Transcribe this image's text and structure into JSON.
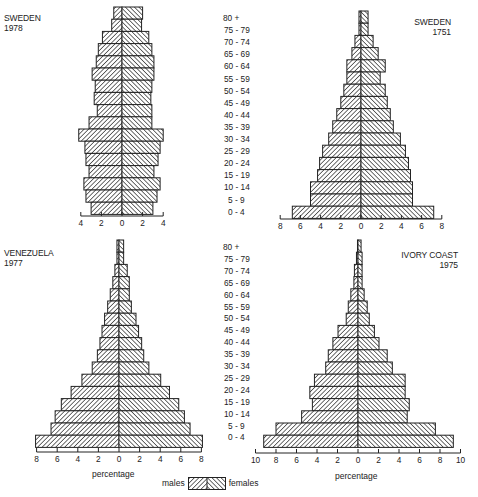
{
  "age_groups": [
    "80 +",
    "75 - 79",
    "70 - 74",
    "65 - 69",
    "60 - 64",
    "55 - 59",
    "50 - 54",
    "45 - 49",
    "40 - 44",
    "35 - 39",
    "30 - 34",
    "25 - 29",
    "20 - 24",
    "15 - 19",
    "10 - 14",
    "5 - 9",
    "0 - 4"
  ],
  "legend": {
    "males": "males",
    "females": "females"
  },
  "axis_title": "percentage",
  "colors": {
    "ink": "#222222",
    "fill": "#ffffff"
  },
  "chart_data": [
    {
      "type": "bar",
      "subtype": "population-pyramid",
      "title": "SWEDEN 1978",
      "country": "SWEDEN",
      "year": "1978",
      "xlabel": "",
      "ylabel": "age group",
      "x_ticks": [
        4,
        2,
        0,
        2,
        4
      ],
      "xlim": [
        -4,
        4
      ],
      "categories": [
        "80 +",
        "75 - 79",
        "70 - 74",
        "65 - 69",
        "60 - 64",
        "55 - 59",
        "50 - 54",
        "45 - 49",
        "40 - 44",
        "35 - 39",
        "30 - 34",
        "25 - 29",
        "20 - 24",
        "15 - 19",
        "10 - 14",
        "5 - 9",
        "0 - 4"
      ],
      "series": [
        {
          "name": "males",
          "values": [
            0.8,
            1.0,
            1.9,
            2.3,
            2.5,
            2.9,
            2.6,
            2.7,
            2.4,
            3.2,
            4.2,
            3.6,
            3.5,
            3.2,
            3.7,
            3.5,
            3.0
          ]
        },
        {
          "name": "females",
          "values": [
            2.0,
            1.9,
            2.6,
            2.9,
            3.1,
            3.1,
            2.9,
            2.8,
            2.9,
            2.9,
            4.0,
            3.7,
            3.5,
            3.1,
            3.7,
            3.4,
            3.0
          ]
        }
      ]
    },
    {
      "type": "bar",
      "subtype": "population-pyramid",
      "title": "SWEDEN 1751",
      "country": "SWEDEN",
      "year": "1751",
      "xlabel": "",
      "ylabel": "age group",
      "x_ticks": [
        8,
        6,
        4,
        2,
        0,
        2,
        4,
        6,
        8
      ],
      "xlim": [
        -8,
        8
      ],
      "categories": [
        "80 +",
        "75 - 79",
        "70 - 74",
        "65 - 69",
        "60 - 64",
        "55 - 59",
        "50 - 54",
        "45 - 49",
        "40 - 44",
        "35 - 39",
        "30 - 34",
        "25 - 29",
        "20 - 24",
        "15 - 19",
        "10 - 14",
        "5 - 9",
        "0 - 4"
      ],
      "series": [
        {
          "name": "males",
          "values": [
            0.2,
            0.2,
            0.6,
            0.9,
            1.4,
            1.4,
            1.7,
            2.0,
            2.4,
            2.8,
            3.2,
            3.8,
            4.1,
            4.3,
            5.0,
            5.0,
            6.8
          ]
        },
        {
          "name": "females",
          "values": [
            0.7,
            0.7,
            1.2,
            1.7,
            2.4,
            1.9,
            2.4,
            2.6,
            2.9,
            3.2,
            3.9,
            4.4,
            4.7,
            4.9,
            5.1,
            5.1,
            7.2
          ]
        }
      ]
    },
    {
      "type": "bar",
      "subtype": "population-pyramid",
      "title": "VENEZUELA 1977",
      "country": "VENEZUELA",
      "year": "1977",
      "xlabel": "percentage",
      "ylabel": "age group",
      "x_ticks": [
        8,
        6,
        4,
        2,
        0,
        2,
        4,
        6,
        8
      ],
      "xlim": [
        -8,
        8
      ],
      "categories": [
        "80 +",
        "75 - 79",
        "70 - 74",
        "65 - 69",
        "60 - 64",
        "55 - 59",
        "50 - 54",
        "45 - 49",
        "40 - 44",
        "35 - 39",
        "30 - 34",
        "25 - 29",
        "20 - 24",
        "15 - 19",
        "10 - 14",
        "5 - 9",
        "0 - 4"
      ],
      "series": [
        {
          "name": "males",
          "values": [
            0.2,
            0.2,
            0.4,
            0.6,
            0.85,
            1.1,
            1.4,
            1.65,
            1.85,
            2.1,
            2.6,
            3.6,
            4.65,
            5.6,
            6.2,
            6.6,
            8.1
          ]
        },
        {
          "name": "females",
          "values": [
            0.45,
            0.45,
            0.8,
            1.0,
            1.0,
            1.2,
            1.65,
            1.9,
            2.2,
            2.4,
            2.9,
            4.05,
            4.9,
            5.8,
            6.35,
            6.9,
            8.1
          ]
        }
      ]
    },
    {
      "type": "bar",
      "subtype": "population-pyramid",
      "title": "IVORY COAST 1975",
      "country": "IVORY COAST",
      "year": "1975",
      "xlabel": "percentage",
      "ylabel": "age group",
      "x_ticks": [
        10,
        8,
        6,
        4,
        2,
        0,
        2,
        4,
        6,
        8,
        10
      ],
      "xlim": [
        -10,
        10
      ],
      "categories": [
        "80 +",
        "75 - 79",
        "70 - 74",
        "65 - 69",
        "60 - 64",
        "55 - 59",
        "50 - 54",
        "45 - 49",
        "40 - 44",
        "35 - 39",
        "30 - 34",
        "25 - 29",
        "20 - 24",
        "15 - 19",
        "10 - 14",
        "5 - 9",
        "0 - 4"
      ],
      "series": [
        {
          "name": "males",
          "values": [
            0.05,
            0.15,
            0.35,
            0.4,
            0.7,
            0.95,
            1.15,
            1.95,
            2.45,
            2.9,
            3.15,
            4.25,
            4.7,
            4.45,
            5.5,
            8.0,
            9.2
          ]
        },
        {
          "name": "females",
          "values": [
            0.3,
            0.4,
            0.4,
            0.4,
            0.6,
            0.9,
            1.1,
            1.6,
            2.05,
            2.85,
            3.35,
            4.6,
            4.6,
            5.0,
            4.8,
            7.55,
            9.3
          ]
        }
      ]
    }
  ]
}
